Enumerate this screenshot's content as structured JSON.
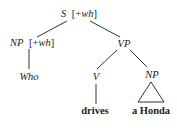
{
  "tree": {
    "root": {
      "label": "S",
      "feature": "[+wh]"
    },
    "subject": {
      "label": "NP",
      "feature": "[+wh]",
      "word": "Who"
    },
    "predicate": {
      "label": "VP",
      "verb": {
        "label": "V",
        "word": "drives"
      },
      "object": {
        "label": "NP",
        "phrase": "a Honda",
        "collapsed": true
      }
    }
  }
}
